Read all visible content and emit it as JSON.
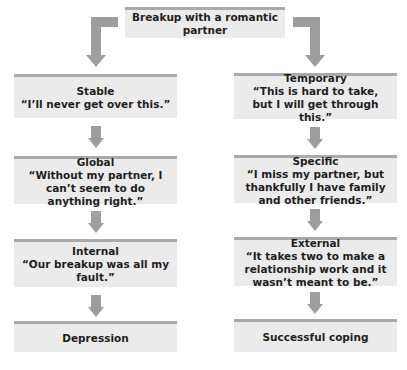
{
  "diagram": {
    "root": {
      "label": "Breakup with a romantic partner"
    },
    "colors": {
      "box_bg": "#ebebeb",
      "box_border": "#a9a9a9",
      "arrow": "#9e9e9e",
      "text": "#1e1e1e"
    },
    "left": {
      "nodes": [
        {
          "title": "Stable",
          "quote": "“I’ll never get over this.”"
        },
        {
          "title": "Global",
          "quote": "“Without my partner, I can’t seem to do anything right.”"
        },
        {
          "title": "Internal",
          "quote": "“Our breakup was all my fault.”"
        }
      ],
      "outcome": "Depression"
    },
    "right": {
      "nodes": [
        {
          "title": "Temporary",
          "quote": "“This is hard to take, but I will get through this.”"
        },
        {
          "title": "Specific",
          "quote": "“I miss my partner, but thankfully I have family and other friends.”"
        },
        {
          "title": "External",
          "quote": "“It takes two to make a relationship work and it wasn’t meant to be.”"
        }
      ],
      "outcome": "Successful coping"
    }
  }
}
